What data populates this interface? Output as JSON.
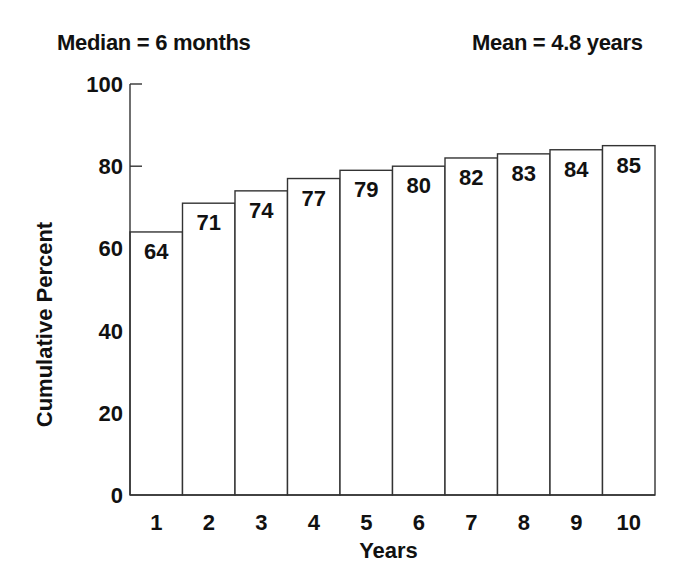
{
  "chart_data": {
    "type": "bar",
    "title": "",
    "annotations": {
      "left": "Median = 6 months",
      "right": "Mean = 4.8 years"
    },
    "xlabel": "Years",
    "ylabel": "Cumulative Percent",
    "categories": [
      "1",
      "2",
      "3",
      "4",
      "5",
      "6",
      "7",
      "8",
      "9",
      "10"
    ],
    "values": [
      64,
      71,
      74,
      77,
      79,
      80,
      82,
      83,
      84,
      85
    ],
    "data_labels": [
      "64",
      "71",
      "74",
      "77",
      "79",
      "80",
      "82",
      "83",
      "84",
      "85"
    ],
    "yticks": [
      0,
      20,
      40,
      60,
      80,
      100
    ],
    "ylim": [
      0,
      100
    ],
    "grid": false,
    "legend": null,
    "bar_fill": "#ffffff",
    "bar_stroke": "#333333"
  }
}
